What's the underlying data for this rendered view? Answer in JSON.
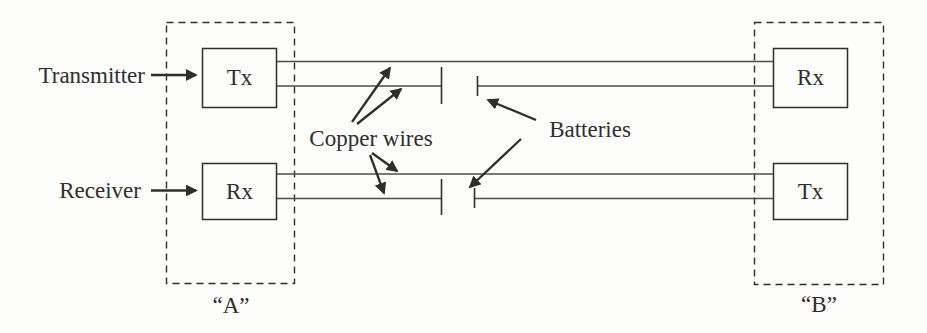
{
  "figure": {
    "colors": {
      "ink": "#2e2e2e",
      "wire": "#4d4d4d",
      "background": "#fdfdfb"
    },
    "stations": {
      "a": {
        "caption": "“A”",
        "top_unit": "Tx",
        "bottom_unit": "Rx"
      },
      "b": {
        "caption": "“B”",
        "top_unit": "Rx",
        "bottom_unit": "Tx"
      }
    },
    "annotations": {
      "transmitter": "Transmitter",
      "receiver": "Receiver",
      "copper_wires": "Copper wires",
      "batteries": "Batteries"
    }
  }
}
